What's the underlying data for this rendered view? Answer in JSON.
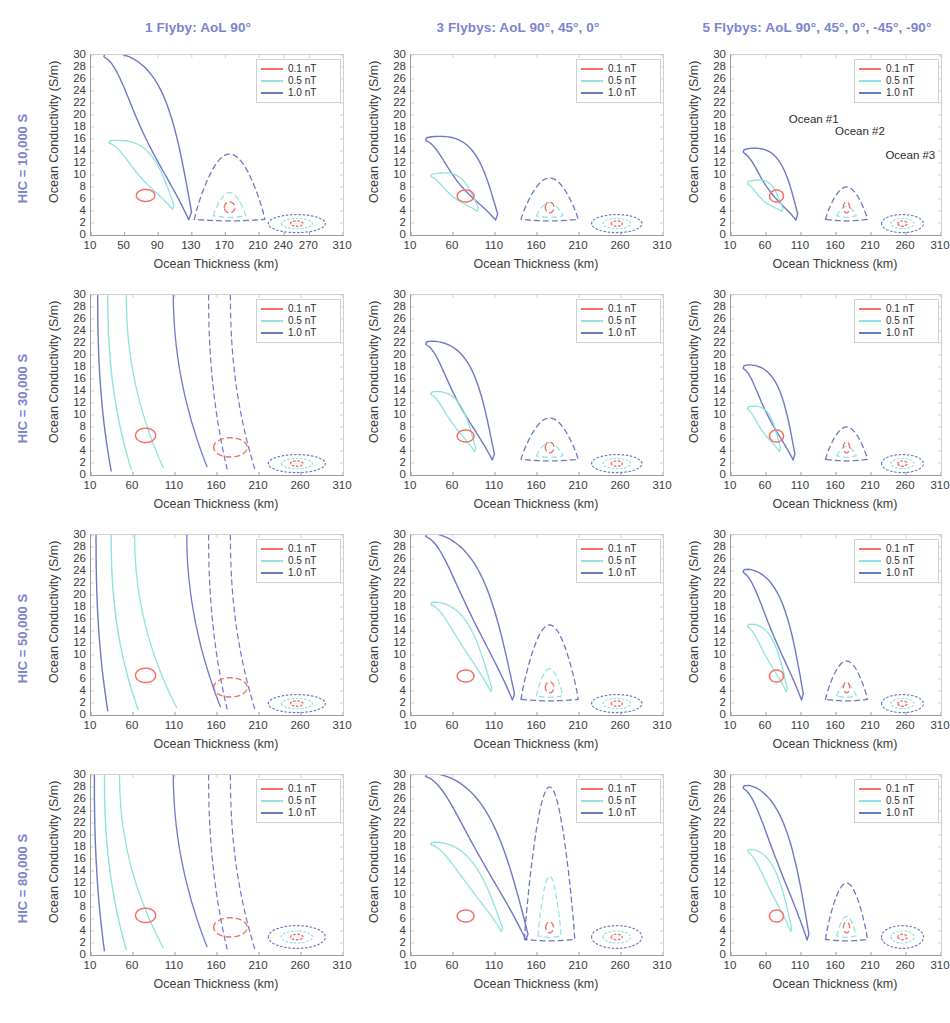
{
  "figure": {
    "x_axis_label": "Ocean Thickness (km)",
    "y_axis_label": "Ocean Conductivity (S/m)",
    "columns": [
      {
        "id": "col-1-flyby",
        "title": "1 Flyby: AoL 90°"
      },
      {
        "id": "col-3-flybys",
        "title": "3 Flybys: AoL 90°, 45°, 0°"
      },
      {
        "id": "col-5-flybys",
        "title": "5 Flybys: AoL  90°, 45°, 0°, -45°, -90°"
      }
    ],
    "rows": [
      {
        "id": "row-hic-10000",
        "label": "HIC = 10,000 S"
      },
      {
        "id": "row-hic-30000",
        "label": "HIC = 30,000 S"
      },
      {
        "id": "row-hic-50000",
        "label": "HIC = 50,000 S"
      },
      {
        "id": "row-hic-80000",
        "label": "HIC = 80,000 S"
      }
    ],
    "legend": {
      "entries": [
        {
          "label": "0.1 nT",
          "color": "#f4726a"
        },
        {
          "label": "0.5 nT",
          "color": "#8fe3de"
        },
        {
          "label": "1.0 nT",
          "color": "#6f78c6"
        }
      ]
    },
    "annotations": [
      {
        "id": "ocean-1",
        "text": "Ocean #1"
      },
      {
        "id": "ocean-2",
        "text": "Ocean #2"
      },
      {
        "id": "ocean-3",
        "text": "Ocean #3"
      }
    ],
    "colors": {
      "header_blue": "#7b84cf",
      "axis_gray": "#9a9a9a",
      "grid_gray": "#cfcfcf",
      "text_dark": "#3a3a3a"
    }
  },
  "chart_data": {
    "type": "line",
    "title": "",
    "xlabel": "Ocean Thickness (km)",
    "ylabel": "Ocean Conductivity (S/m)",
    "xlim": [
      10,
      310
    ],
    "ylim": [
      0,
      30
    ],
    "yticks": [
      0,
      2,
      4,
      6,
      8,
      10,
      12,
      14,
      16,
      18,
      20,
      22,
      24,
      26,
      28,
      30
    ],
    "grid": "dotted-light",
    "legend_position": "top-right",
    "series_levels": [
      "0.1 nT",
      "0.5 nT",
      "1.0 nT"
    ],
    "ocean_centers": [
      {
        "name": "Ocean #1",
        "thickness_km": 75,
        "conductivity_S_per_m": 6.5,
        "line_style": "solid"
      },
      {
        "name": "Ocean #2",
        "thickness_km": 175,
        "conductivity_S_per_m": 4.5,
        "line_style": "dashed"
      },
      {
        "name": "Ocean #3",
        "thickness_km": 255,
        "conductivity_S_per_m": 1.8,
        "line_style": "dotted"
      }
    ],
    "panels": [
      {
        "row": "HIC = 10,000 S",
        "col": "1 Flyby: AoL 90°",
        "xticks": [
          10,
          50,
          90,
          130,
          170,
          210,
          240,
          270,
          310
        ],
        "note": "Ocean #1 contours form a broad open plume reaching the top axis; Ocean #2 dashed dome peaks near 14 S/m at 160 km; Ocean #3 a thin sliver near 2 S/m."
      },
      {
        "row": "HIC = 10,000 S",
        "col": "3 Flybys: AoL 90°, 45°, 0°",
        "xticks": [
          10,
          60,
          110,
          160,
          210,
          260,
          310
        ],
        "note": "Ocean #1 closed teardrop peaking near 16 S/m; Ocean #2 dashed dome to ~9 S/m; Ocean #3 flat sliver near 2 S/m."
      },
      {
        "row": "HIC = 10,000 S",
        "col": "5 Flybys: AoL  90°, 45°, 0°, -45°, -90°",
        "xticks": [
          10,
          60,
          110,
          160,
          210,
          260,
          310
        ],
        "note": "Tightest closed contours; Ocean #1 peak ~14 S/m, Ocean #2 dome ~8 S/m, Ocean #3 sliver ~2 S/m."
      },
      {
        "row": "HIC = 30,000 S",
        "col": "1 Flyby: AoL 90°",
        "xticks": [
          10,
          60,
          110,
          160,
          210,
          260,
          310
        ],
        "note": "Contours open and sweep off the top of the axis; strong degeneracy."
      },
      {
        "row": "HIC = 30,000 S",
        "col": "3 Flybys: AoL 90°, 45°, 0°",
        "xticks": [
          10,
          60,
          110,
          160,
          210,
          260,
          310
        ],
        "note": "Ocean #1 closed teardrop peaking near 22 S/m."
      },
      {
        "row": "HIC = 30,000 S",
        "col": "5 Flybys: AoL  90°, 45°, 0°, -45°, -90°",
        "xticks": [
          10,
          60,
          110,
          160,
          210,
          260,
          310
        ],
        "note": "Ocean #1 closed teardrop peaking near 18 S/m."
      },
      {
        "row": "HIC = 50,000 S",
        "col": "1 Flyby: AoL 90°",
        "xticks": [
          10,
          60,
          110,
          160,
          210,
          260,
          310
        ],
        "note": "All contours open, running off the top axis; no closure."
      },
      {
        "row": "HIC = 50,000 S",
        "col": "3 Flybys: AoL 90°, 45°, 0°",
        "xticks": [
          10,
          60,
          110,
          160,
          210,
          260,
          310
        ],
        "note": "Ocean #1 1.0 nT contour reaches 30 S/m; Ocean #2 dashed dome peaks ~15 S/m."
      },
      {
        "row": "HIC = 50,000 S",
        "col": "5 Flybys: AoL  90°, 45°, 0°, -45°, -90°",
        "xticks": [
          10,
          60,
          110,
          160,
          210,
          260,
          310
        ],
        "note": "Ocean #1 closed contour peaking near 24 S/m."
      },
      {
        "row": "HIC = 80,000 S",
        "col": "1 Flyby: AoL 90°",
        "xticks": [
          10,
          60,
          110,
          160,
          210,
          260,
          310
        ],
        "note": "Highly degenerate; near-vertical open contours across the whole thickness range."
      },
      {
        "row": "HIC = 80,000 S",
        "col": "3 Flybys: AoL 90°, 45°, 0°",
        "xticks": [
          10,
          60,
          110,
          160,
          210,
          260,
          310
        ],
        "note": "Ocean #1 open to 30 S/m; Ocean #2 tall dashed dome reaching ~28 S/m near 160 km."
      },
      {
        "row": "HIC = 80,000 S",
        "col": "5 Flybys: AoL  90°, 45°, 0°, -45°, -90°",
        "xticks": [
          10,
          60,
          110,
          160,
          210,
          260,
          310
        ],
        "note": "Ocean #1 closed contour to ~28 S/m; Ocean #2 dome ~12 S/m; Ocean #3 sliver ~4 S/m."
      }
    ]
  }
}
